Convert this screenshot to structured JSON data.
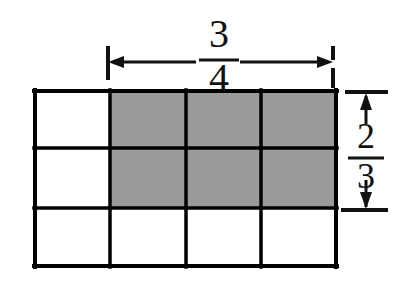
{
  "figure": {
    "kind": "fraction-area-model",
    "colors": {
      "shaded_fill": "#9a9a9a",
      "unshaded_fill": "#ffffff",
      "line": "#000000",
      "text": "#111111",
      "background": "#ffffff"
    },
    "grid": {
      "columns": 4,
      "rows": 3,
      "shaded_columns": 3,
      "shaded_rows": 2,
      "shaded_cells": 6,
      "total_cells": 12,
      "cells": [
        [
          "plain",
          "shaded",
          "shaded",
          "shaded"
        ],
        [
          "plain",
          "shaded",
          "shaded",
          "shaded"
        ],
        [
          "plain",
          "plain",
          "plain",
          "plain"
        ]
      ]
    },
    "labels": {
      "width": {
        "name": "width-fraction",
        "numerator": "3",
        "denominator": "4",
        "value": "3/4",
        "position": "top"
      },
      "height": {
        "name": "height-fraction",
        "numerator": "2",
        "denominator": "3",
        "value": "2/3",
        "position": "right"
      }
    },
    "annotations": {
      "top_measure": {
        "name": "horizontal-dimension-arrow",
        "style": "double-headed-arrow-with-end-ticks"
      },
      "right_measure": {
        "name": "vertical-dimension-arrow",
        "style": "double-headed-arrow-with-end-ticks"
      }
    }
  }
}
